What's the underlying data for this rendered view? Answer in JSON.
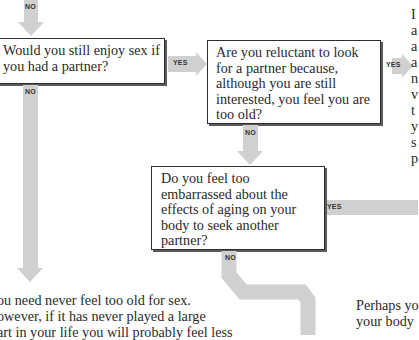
{
  "flowchart": {
    "top_arrow": {
      "label": "NO"
    },
    "question_1": {
      "lines": [
        "Would you still enjoy sex if",
        "you had a partner?"
      ],
      "yes_label": "YES",
      "no_label": "NO"
    },
    "question_2": {
      "lines": [
        "Are you reluctant to look",
        "for a partner because,",
        "although you are still",
        "interested, you feel you are",
        "too old?"
      ],
      "yes_label": "YES",
      "no_label": "NO"
    },
    "question_3": {
      "lines": [
        "Do you feel too",
        "embarrassed about the",
        "effects of aging on your",
        "body to seek another",
        "partner?"
      ],
      "yes_label": "YES",
      "no_label": "NO"
    },
    "answer_right_top": {
      "lines": [
        "I",
        "a",
        "a",
        "a",
        "n",
        "v",
        "t",
        "y",
        "s",
        "p"
      ]
    },
    "answer_bottom_left": {
      "lines": [
        "ou need never feel too old for sex.",
        "owever, if it has never played a large",
        "art in your life you will probably feel less"
      ]
    },
    "answer_bottom_right": {
      "lines": [
        "Perhaps yo",
        "your body"
      ]
    },
    "colors": {
      "arrow": "#d0d0d0",
      "box_border": "#2e2e2e",
      "text": "#2a2a2a"
    }
  }
}
